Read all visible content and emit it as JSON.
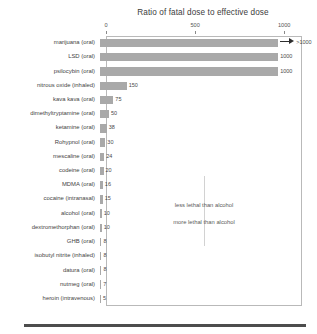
{
  "chart_data": {
    "type": "bar",
    "orientation": "horizontal",
    "title": "Ratio of fatal dose to effective dose",
    "xlabel": "",
    "ylabel": "",
    "xlim": [
      0,
      1100
    ],
    "xticks": [
      0,
      500,
      1000
    ],
    "xtick_labels": [
      "0",
      "500",
      "1000"
    ],
    "grid": false,
    "legend": null,
    "bar_color": "#a9a9a9",
    "categories": [
      "marijuana (oral)",
      "LSD (oral)",
      "psilocybin (oral)",
      "nitrous oxide (inhaled)",
      "kava kava (oral)",
      "dimethyltryptamine (oral)",
      "ketamine (oral)",
      "Rohypnol (oral)",
      "mescaline (oral)",
      "codeine (oral)",
      "MDMA (oral)",
      "cocaine (intranasal)",
      "alcohol (oral)",
      "dextromethorphan (oral)",
      "GHB (oral)",
      "isobutyl nitrite (inhaled)",
      "datura (oral)",
      "nutmeg (oral)",
      "heroin (intravenous)"
    ],
    "values": [
      1000,
      1000,
      1000,
      150,
      75,
      50,
      38,
      30,
      24,
      20,
      16,
      15,
      10,
      10,
      8,
      8,
      8,
      7,
      5
    ],
    "value_labels": [
      ">1000",
      "1000",
      "1000",
      "150",
      "75",
      "50",
      "38",
      "30",
      "24",
      "20",
      "16",
      "15",
      "10",
      "10",
      "8",
      "8",
      "8",
      "7",
      "5"
    ],
    "annotations": [
      "less lethal than alcohol",
      "more lethal than alcohol"
    ]
  }
}
